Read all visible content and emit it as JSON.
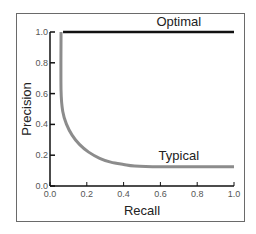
{
  "chart_data": {
    "type": "line",
    "title": "",
    "xlabel": "Recall",
    "ylabel": "Precision",
    "xlim": [
      0.0,
      1.0
    ],
    "ylim": [
      0.0,
      1.0
    ],
    "xticks": [
      "0.0",
      "0.2",
      "0.4",
      "0.6",
      "0.8",
      "1.0"
    ],
    "yticks": [
      "0.0",
      "0.2",
      "0.4",
      "0.6",
      "0.8",
      "1.0"
    ],
    "grid": false,
    "legend": "none",
    "series": [
      {
        "name": "Optimal",
        "color": "#111111",
        "x": [
          0.06,
          0.06,
          1.0
        ],
        "y": [
          0.0,
          1.0,
          1.0
        ],
        "label_anchor": "top-right"
      },
      {
        "name": "Typical",
        "color": "#8c8c8c",
        "x": [
          0.06,
          0.06,
          0.07,
          0.09,
          0.12,
          0.16,
          0.21,
          0.27,
          0.33,
          0.4,
          0.46,
          0.6,
          0.8,
          1.0
        ],
        "y": [
          1.0,
          0.62,
          0.48,
          0.4,
          0.33,
          0.27,
          0.22,
          0.18,
          0.155,
          0.14,
          0.13,
          0.125,
          0.125,
          0.125
        ],
        "label_anchor": "center-right"
      }
    ]
  }
}
